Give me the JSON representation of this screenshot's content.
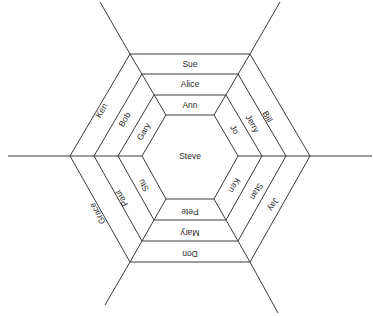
{
  "diagram": {
    "type": "hexagonal-sociogram",
    "center": {
      "label": "Steve"
    },
    "rings": [
      {
        "level": 1,
        "top": "Ann",
        "top_right": "Jo",
        "bottom_right": "Ken",
        "bottom": "Pete",
        "bottom_left": "Stu",
        "top_left": "Gary"
      },
      {
        "level": 2,
        "top": "Alice",
        "top_right": "Jerry",
        "bottom_right": "Stan",
        "bottom": "Mary",
        "bottom_left": "Paul",
        "top_left": "Bob"
      },
      {
        "level": 3,
        "top": "Sue",
        "top_right": "Bill",
        "bottom_right": "Jay",
        "bottom": "Don",
        "bottom_left": "Grace",
        "top_left": "Ken"
      }
    ],
    "colors": {
      "line": "#3a3a3a",
      "text": "#2a2a2a",
      "background": "#ffffff"
    }
  }
}
